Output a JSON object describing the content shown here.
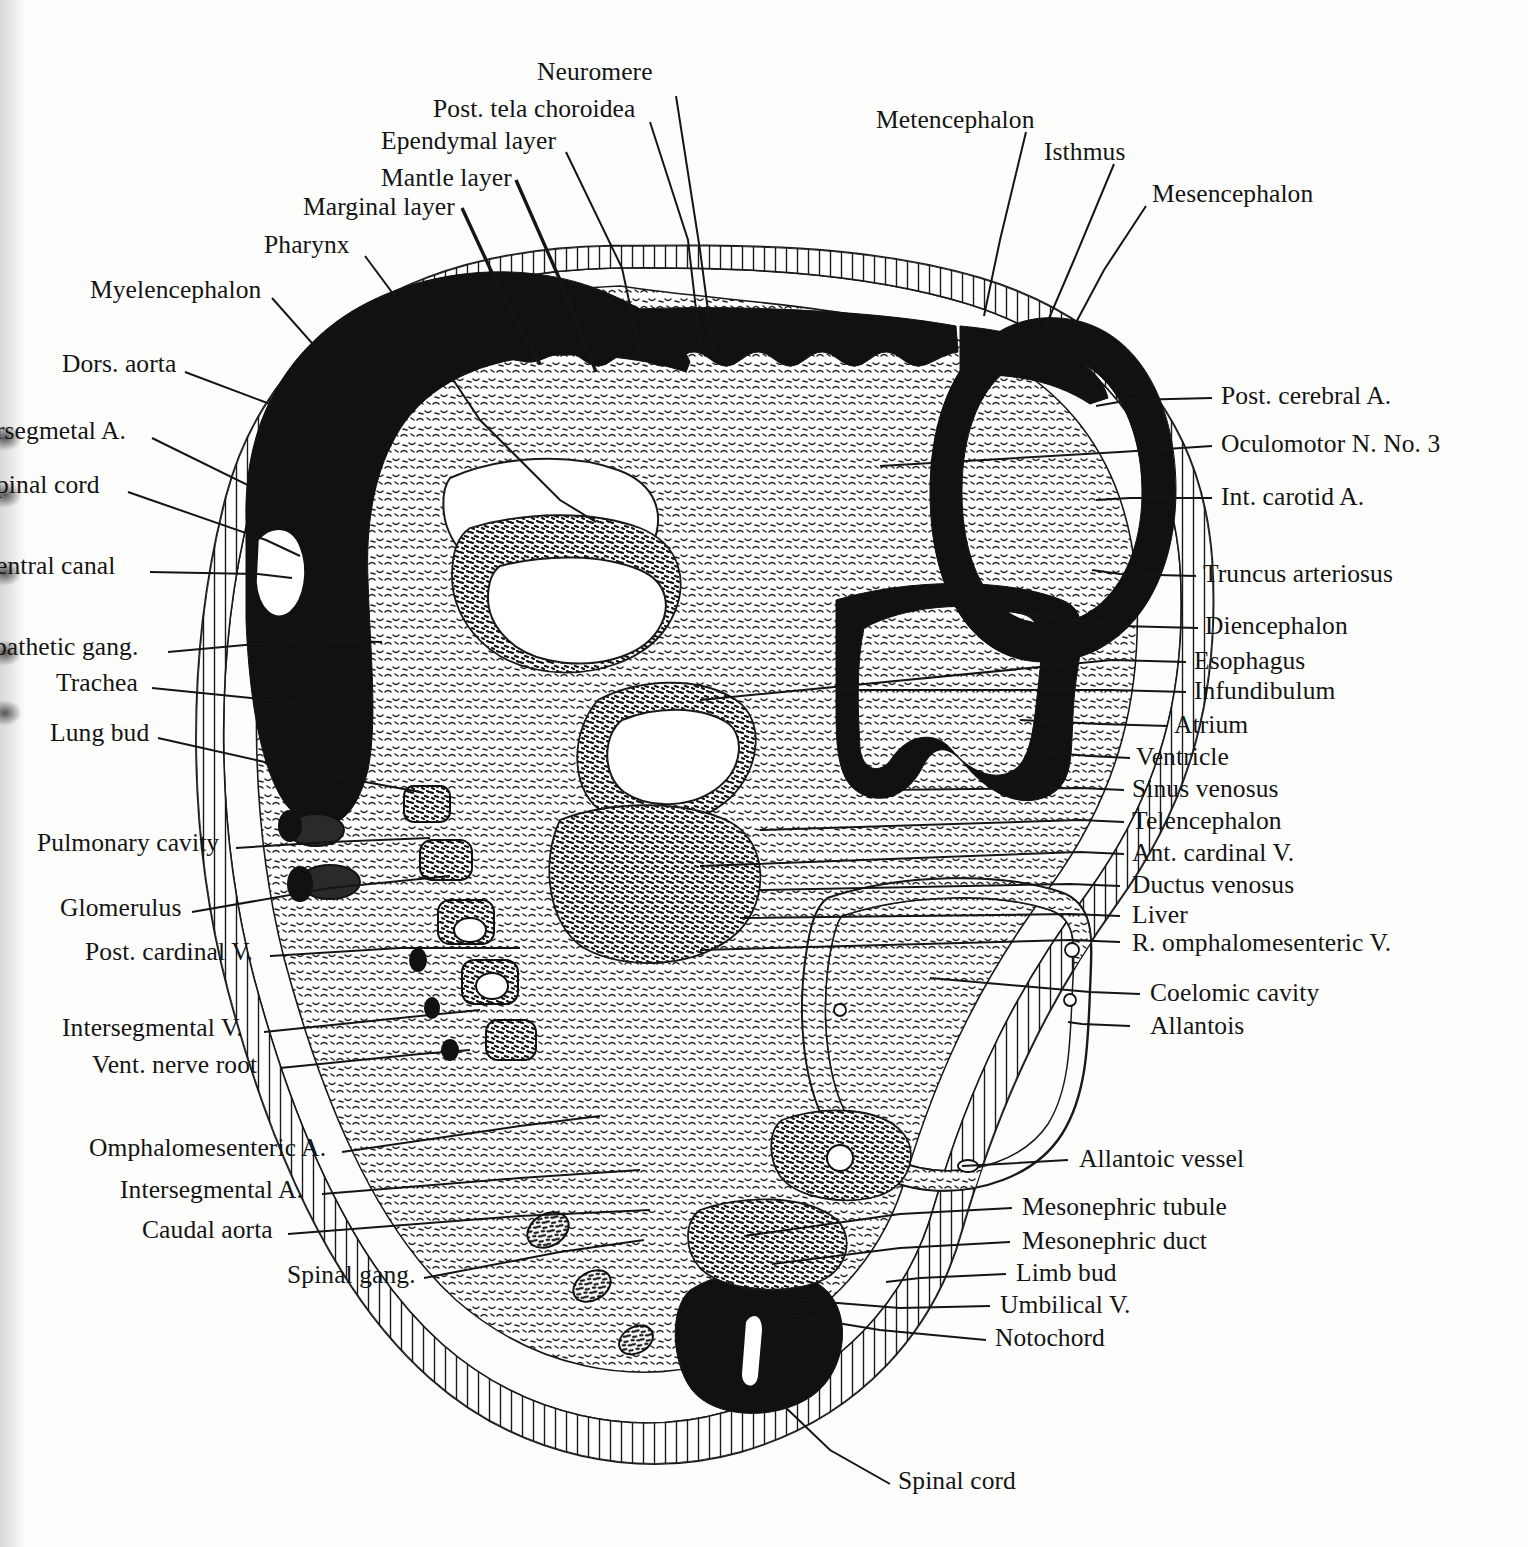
{
  "figure": {
    "kind": "labeled-anatomical-section"
  },
  "labels_top": [
    {
      "id": "neuromere",
      "text": "Neuromere"
    },
    {
      "id": "post-tela-choroidea",
      "text": "Post. tela choroidea"
    },
    {
      "id": "ependymal-layer",
      "text": "Ependymal layer"
    },
    {
      "id": "mantle-layer",
      "text": "Mantle layer"
    },
    {
      "id": "marginal-layer",
      "text": "Marginal layer"
    },
    {
      "id": "pharynx",
      "text": "Pharynx"
    },
    {
      "id": "myelencephalon",
      "text": "Myelencephalon"
    },
    {
      "id": "metencephalon",
      "text": "Metencephalon"
    },
    {
      "id": "isthmus",
      "text": "Isthmus"
    },
    {
      "id": "mesencephalon",
      "text": "Mesencephalon"
    }
  ],
  "labels_left": [
    {
      "id": "dors-aorta",
      "text": "Dors. aorta"
    },
    {
      "id": "intersegmental-artery",
      "text": "rsegmetal A."
    },
    {
      "id": "spinal-cord-left",
      "text": "pinal cord"
    },
    {
      "id": "central-canal",
      "text": "entral canal"
    },
    {
      "id": "sympathetic-gang",
      "text": "pathetic gang."
    },
    {
      "id": "trachea",
      "text": "Trachea"
    },
    {
      "id": "lung-bud",
      "text": "Lung bud"
    },
    {
      "id": "pulmonary-cavity",
      "text": "Pulmonary cavity"
    },
    {
      "id": "glomerulus",
      "text": "Glomerulus"
    },
    {
      "id": "post-cardinal-vein",
      "text": "Post. cardinal V."
    },
    {
      "id": "intersegmental-vein",
      "text": "Intersegmental V."
    },
    {
      "id": "vent-nerve-root",
      "text": "Vent. nerve root"
    },
    {
      "id": "omphalomesenteric-a",
      "text": "Omphalomesenteric A."
    },
    {
      "id": "intersegmental-a",
      "text": "Intersegmental A."
    },
    {
      "id": "caudal-aorta",
      "text": "Caudal aorta"
    },
    {
      "id": "spinal-gang",
      "text": "Spinal gang."
    }
  ],
  "labels_right": [
    {
      "id": "post-cerebral-artery",
      "text": "Post. cerebral A."
    },
    {
      "id": "oculomotor-nerve",
      "text": "Oculomotor N. No. 3"
    },
    {
      "id": "int-carotid-artery",
      "text": "Int. carotid A."
    },
    {
      "id": "truncus-arteriosus",
      "text": "Truncus arteriosus"
    },
    {
      "id": "diencephalon",
      "text": "Diencephalon"
    },
    {
      "id": "esophagus",
      "text": "Esophagus"
    },
    {
      "id": "infundibulum",
      "text": "Infundibulum"
    },
    {
      "id": "atrium",
      "text": "Atrium"
    },
    {
      "id": "ventricle",
      "text": "Ventricle"
    },
    {
      "id": "sinus-venosus",
      "text": "Sinus venosus"
    },
    {
      "id": "telencephalon",
      "text": "Telencephalon"
    },
    {
      "id": "ant-cardinal-vein",
      "text": "Ant. cardinal V."
    },
    {
      "id": "ductus-venosus",
      "text": "Ductus venosus"
    },
    {
      "id": "liver",
      "text": "Liver"
    },
    {
      "id": "r-omphalomesenteric-v",
      "text": "R. omphalomesenteric V."
    },
    {
      "id": "coelomic-cavity",
      "text": "Coelomic cavity"
    },
    {
      "id": "allantois",
      "text": "Allantois"
    },
    {
      "id": "allantoic-vessel",
      "text": "Allantoic vessel"
    },
    {
      "id": "mesonephric-tubule",
      "text": "Mesonephric tubule"
    },
    {
      "id": "mesonephric-duct",
      "text": "Mesonephric duct"
    },
    {
      "id": "limb-bud",
      "text": "Limb bud"
    },
    {
      "id": "umbilical-vein",
      "text": "Umbilical V."
    },
    {
      "id": "notochord",
      "text": "Notochord"
    }
  ],
  "labels_bottom": [
    {
      "id": "spinal-cord-bottom",
      "text": "Spinal cord"
    }
  ],
  "colors": {
    "ink": "#141414",
    "paper": "#fdfdfc",
    "solid_fill": "#111111"
  }
}
